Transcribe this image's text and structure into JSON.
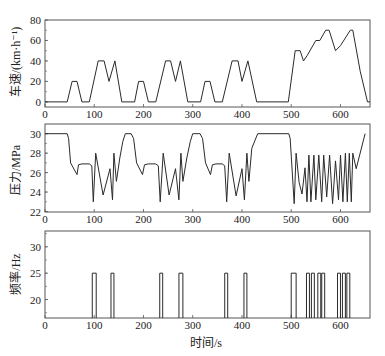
{
  "chart_data": [
    {
      "type": "line",
      "title": "",
      "xlabel": "",
      "ylabel": "车速/(km·h⁻¹)",
      "xlim": [
        0,
        660
      ],
      "ylim": [
        -5,
        80
      ],
      "xticks": [
        0,
        100,
        200,
        300,
        400,
        500,
        600
      ],
      "yticks": [
        0,
        20,
        40,
        60,
        80
      ],
      "grid": false,
      "series": [
        {
          "name": "车速",
          "x": [
            0,
            45,
            55,
            65,
            75,
            90,
            108,
            120,
            130,
            142,
            156,
            182,
            190,
            200,
            210,
            225,
            245,
            255,
            265,
            275,
            290,
            316,
            325,
            335,
            345,
            360,
            380,
            392,
            400,
            412,
            430,
            494,
            508,
            518,
            525,
            532,
            550,
            558,
            570,
            577,
            590,
            600,
            620,
            625,
            640,
            655,
            660
          ],
          "y": [
            0,
            0,
            20,
            20,
            0,
            0,
            40,
            40,
            20,
            40,
            0,
            0,
            20,
            20,
            0,
            0,
            40,
            40,
            20,
            40,
            0,
            0,
            20,
            20,
            0,
            0,
            40,
            40,
            20,
            40,
            0,
            0,
            50,
            50,
            40,
            45,
            60,
            60,
            70,
            70,
            50,
            55,
            70,
            70,
            30,
            0,
            0
          ]
        }
      ]
    },
    {
      "type": "line",
      "title": "",
      "xlabel": "",
      "ylabel": "压力/MPa",
      "xlim": [
        0,
        660
      ],
      "ylim": [
        22,
        31
      ],
      "xticks": [
        0,
        100,
        200,
        300,
        400,
        500,
        600
      ],
      "yticks": [
        22,
        24,
        26,
        28,
        30
      ],
      "grid": false,
      "series": [
        {
          "name": "压力",
          "x": [
            0,
            45,
            48,
            52,
            65,
            68,
            75,
            90,
            95,
            98,
            103,
            118,
            132,
            137,
            140,
            145,
            152,
            158,
            163,
            175,
            180,
            186,
            198,
            202,
            210,
            225,
            230,
            234,
            240,
            252,
            265,
            272,
            276,
            280,
            288,
            295,
            300,
            315,
            320,
            326,
            336,
            340,
            347,
            360,
            365,
            369,
            374,
            388,
            400,
            405,
            410,
            414,
            420,
            432,
            495,
            498,
            506,
            510,
            516,
            522,
            528,
            532,
            536,
            540,
            546,
            550,
            556,
            562,
            566,
            572,
            578,
            584,
            590,
            596,
            600,
            605,
            610,
            614,
            618,
            622,
            625,
            632,
            650
          ],
          "y": [
            30,
            30,
            29.5,
            27,
            25.8,
            26.8,
            26.9,
            26.9,
            26.7,
            23,
            28,
            23.7,
            26.4,
            23.2,
            28,
            25.1,
            27.5,
            29.2,
            30,
            30,
            29.5,
            27,
            25.8,
            26.8,
            26.9,
            26.9,
            26.7,
            23,
            28,
            23.7,
            26.4,
            23.2,
            28,
            25.1,
            27.5,
            29.2,
            30,
            30,
            29.5,
            27,
            25.8,
            26.8,
            26.9,
            26.9,
            26.7,
            23,
            28,
            23.6,
            26.4,
            23.2,
            28,
            25.1,
            28.5,
            30,
            30,
            29.5,
            22.8,
            28,
            25,
            23.8,
            26.5,
            23,
            27.8,
            23,
            27.8,
            23.2,
            27.8,
            23,
            27.8,
            23.5,
            27.8,
            22.8,
            27.2,
            23.2,
            27.8,
            23,
            28,
            23,
            28,
            23,
            28,
            26.4,
            30,
            30
          ]
        }
      ]
    },
    {
      "type": "line",
      "title": "",
      "xlabel": "时间/s",
      "ylabel": "频率/Hz",
      "xlim": [
        0,
        660
      ],
      "ylim": [
        16.5,
        33
      ],
      "xticks": [
        0,
        100,
        200,
        300,
        400,
        500,
        600
      ],
      "yticks": [
        20,
        25,
        30
      ],
      "grid": false,
      "series": [
        {
          "name": "频率",
          "pulses": [
            {
              "start": 96,
              "end": 104,
              "value": 25
            },
            {
              "start": 134,
              "end": 140,
              "value": 25
            },
            {
              "start": 233,
              "end": 239,
              "value": 25
            },
            {
              "start": 272,
              "end": 280,
              "value": 25
            },
            {
              "start": 365,
              "end": 371,
              "value": 25
            },
            {
              "start": 404,
              "end": 410,
              "value": 25
            },
            {
              "start": 500,
              "end": 510,
              "value": 25
            },
            {
              "start": 531,
              "end": 537,
              "value": 25
            },
            {
              "start": 541,
              "end": 547,
              "value": 25
            },
            {
              "start": 554,
              "end": 560,
              "value": 25
            },
            {
              "start": 562,
              "end": 568,
              "value": 25
            },
            {
              "start": 594,
              "end": 600,
              "value": 25
            },
            {
              "start": 604,
              "end": 610,
              "value": 25
            },
            {
              "start": 613,
              "end": 619,
              "value": 25
            }
          ],
          "baseline": 16.5
        }
      ]
    }
  ],
  "labels": {
    "panel1_ylabel": "车速/(km·h⁻¹)",
    "panel2_ylabel": "压力/MPa",
    "panel3_ylabel": "频率/Hz",
    "xlabel": "时间/s"
  },
  "colors": {
    "line": "#2a2a2a",
    "frame": "#555555",
    "text": "#222222"
  }
}
